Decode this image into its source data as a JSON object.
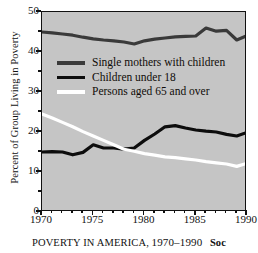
{
  "figure": {
    "ylabel": "Percent of Group Living in Poverty",
    "caption_label": "POVERTY IN AMERICA,",
    "caption_years": "1970–1990",
    "caption_tail": "Soc",
    "plot_bg": "#c5c5c5",
    "frame_color": "#111111"
  },
  "legend": {
    "items": [
      {
        "label": "Single mothers with children",
        "color": "#3a3a3a"
      },
      {
        "label": "Children under 18",
        "color": "#0d0d0d"
      },
      {
        "label": "Persons aged 65 and over",
        "color": "#ffffff"
      }
    ]
  },
  "chart_data": {
    "type": "line",
    "title": "POVERTY IN AMERICA, 1970–1990",
    "xlabel": "",
    "ylabel": "Percent of Group Living in Poverty",
    "xlim": [
      1970,
      1990
    ],
    "ylim": [
      0,
      50
    ],
    "ytick_labels": [
      "0",
      "10",
      "20",
      "30",
      "40",
      "50"
    ],
    "yticks": [
      0,
      10,
      20,
      30,
      40,
      50
    ],
    "yticks_minor": [
      5,
      15,
      25,
      35,
      45
    ],
    "xtick_labels": [
      "1970",
      "1975",
      "1980",
      "1985",
      "1990"
    ],
    "xticks": [
      1970,
      1975,
      1980,
      1985,
      1990
    ],
    "grid": false,
    "legend_position": "upper-left-inside",
    "x": [
      1970,
      1971,
      1972,
      1973,
      1974,
      1975,
      1976,
      1977,
      1978,
      1979,
      1980,
      1981,
      1982,
      1983,
      1984,
      1985,
      1986,
      1987,
      1988,
      1989,
      1990
    ],
    "series": [
      {
        "name": "Single mothers with children",
        "color": "#3a3a3a",
        "values": [
          45.0,
          44.8,
          44.5,
          44.2,
          43.7,
          43.3,
          43.0,
          42.8,
          42.5,
          42.0,
          42.8,
          43.2,
          43.5,
          43.8,
          43.9,
          44.0,
          46.0,
          45.2,
          45.4,
          43.0,
          44.1
        ]
      },
      {
        "name": "Children under 18",
        "color": "#0d0d0d",
        "values": [
          15.0,
          15.1,
          15.0,
          14.3,
          14.9,
          16.8,
          16.0,
          16.0,
          15.7,
          16.0,
          17.9,
          19.5,
          21.3,
          21.6,
          21.0,
          20.5,
          20.2,
          20.0,
          19.4,
          19.0,
          19.9
        ]
      },
      {
        "name": "Persons aged 65 and over",
        "color": "#ffffff",
        "values": [
          24.5,
          23.5,
          22.4,
          21.3,
          20.1,
          19.0,
          17.9,
          16.8,
          15.7,
          15.2,
          14.6,
          14.2,
          13.8,
          13.6,
          13.3,
          13.0,
          12.6,
          12.3,
          12.0,
          11.4,
          12.2
        ]
      }
    ]
  }
}
